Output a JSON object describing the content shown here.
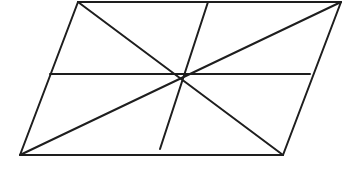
{
  "diagram": {
    "type": "geometry",
    "stroke_color": "#1e1e1e",
    "background": "#ffffff",
    "vertices": {
      "top_left": [
        78,
        2
      ],
      "top_right": [
        341,
        2
      ],
      "bottom_right": [
        283,
        155
      ],
      "bottom_left": [
        20,
        155
      ],
      "center": [
        182,
        75
      ]
    },
    "segments": [
      {
        "name": "side-top",
        "x1": 78,
        "y1": 2,
        "x2": 341,
        "y2": 2
      },
      {
        "name": "side-right",
        "x1": 341,
        "y1": 2,
        "x2": 283,
        "y2": 155
      },
      {
        "name": "side-bottom",
        "x1": 283,
        "y1": 155,
        "x2": 20,
        "y2": 155
      },
      {
        "name": "side-left",
        "x1": 20,
        "y1": 155,
        "x2": 78,
        "y2": 2
      },
      {
        "name": "diagonal-tl-br",
        "x1": 78,
        "y1": 2,
        "x2": 283,
        "y2": 155
      },
      {
        "name": "diagonal-bl-tr",
        "x1": 20,
        "y1": 155,
        "x2": 341,
        "y2": 2
      },
      {
        "name": "horizontal-midline",
        "x1": 50,
        "y1": 74,
        "x2": 310,
        "y2": 74
      },
      {
        "name": "slanted-midline",
        "x1": 208,
        "y1": 2,
        "x2": 160,
        "y2": 149
      }
    ]
  }
}
